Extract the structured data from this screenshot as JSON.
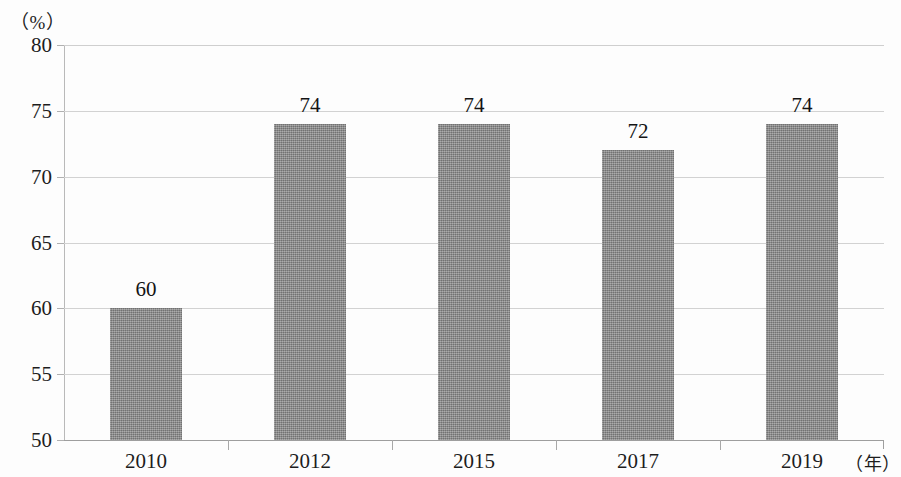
{
  "chart_data": {
    "type": "bar",
    "title": "",
    "subtitle": "",
    "categories": [
      "2010",
      "2012",
      "2015",
      "2017",
      "2019"
    ],
    "values": [
      60,
      74,
      74,
      72,
      74
    ],
    "series": [
      {
        "name": "",
        "values": [
          60,
          74,
          74,
          72,
          74
        ]
      }
    ],
    "data_labels": [
      "60",
      "74",
      "74",
      "72",
      "74"
    ],
    "xlabel": "（年）",
    "ylabel": "（%）",
    "ylim": [
      50,
      80
    ],
    "ytick_step": 5,
    "ytick_labels": [
      "80",
      "75",
      "70",
      "65",
      "60",
      "55",
      "50"
    ],
    "ytick_values": [
      80,
      75,
      70,
      65,
      60,
      55,
      50
    ],
    "grid": true,
    "grid_axis": "y",
    "legend": false,
    "legend_position": "none",
    "bar_color": "#8b8b8b",
    "grid_color": "#d2d2d2",
    "axis_color": "#9e9e9e",
    "text_color": "#1d1d1d",
    "background_color": "#fdfdfd"
  },
  "axis": {
    "y_unit": "（%）",
    "x_unit": "（年）"
  }
}
